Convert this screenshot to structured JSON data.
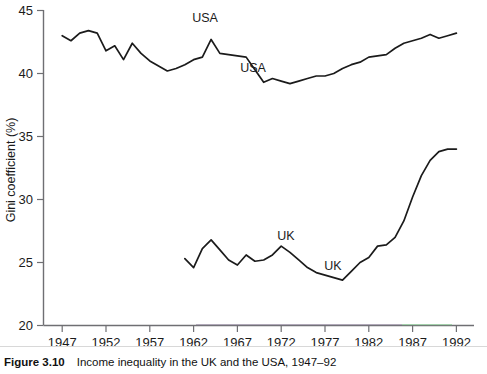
{
  "figure": {
    "number_label": "Figure 3.10",
    "caption": "Income inequality in the UK and the USA, 1947–92"
  },
  "axes": {
    "y_title": "Gini coefficient (%)",
    "y_ticks": [
      "20",
      "25",
      "30",
      "35",
      "40",
      "45"
    ],
    "x_ticks": [
      "1947",
      "1952",
      "1957",
      "1962",
      "1967",
      "1972",
      "1977",
      "1982",
      "1987",
      "1992"
    ]
  },
  "annotations": [
    {
      "name": "usa-label-upper",
      "text": "USA",
      "x": 205,
      "y": 22
    },
    {
      "name": "usa-label-lower",
      "text": "USA",
      "x": 253,
      "y": 72
    },
    {
      "name": "uk-label-upper",
      "text": "UK",
      "x": 286,
      "y": 240
    },
    {
      "name": "uk-label-lower",
      "text": "UK",
      "x": 333,
      "y": 270
    }
  ],
  "chart_data": {
    "type": "line",
    "title": "Income inequality in the UK and the USA, 1947–92",
    "xlabel": "",
    "ylabel": "Gini coefficient (%)",
    "xlim": [
      1946,
      1993
    ],
    "ylim": [
      20,
      45
    ],
    "grid": false,
    "legend": "inline-labels",
    "x": [
      1947,
      1948,
      1949,
      1950,
      1951,
      1952,
      1953,
      1954,
      1955,
      1956,
      1957,
      1958,
      1959,
      1960,
      1961,
      1962,
      1963,
      1964,
      1965,
      1966,
      1967,
      1968,
      1969,
      1970,
      1971,
      1972,
      1973,
      1974,
      1975,
      1976,
      1977,
      1978,
      1979,
      1980,
      1981,
      1982,
      1983,
      1984,
      1985,
      1986,
      1987,
      1988,
      1989,
      1990,
      1991,
      1992
    ],
    "series": [
      {
        "name": "USA",
        "color": "#1b1b1b",
        "values": [
          43.0,
          42.6,
          43.2,
          43.4,
          43.2,
          41.8,
          42.2,
          41.1,
          42.4,
          41.6,
          41.0,
          40.6,
          40.2,
          40.4,
          40.7,
          41.1,
          41.3,
          42.7,
          41.6,
          41.5,
          41.4,
          41.3,
          40.3,
          39.3,
          39.6,
          39.4,
          39.2,
          39.4,
          39.6,
          39.8,
          39.8,
          40.0,
          40.4,
          40.7,
          40.9,
          41.3,
          41.4,
          41.5,
          42.0,
          42.4,
          42.6,
          42.8,
          43.1,
          42.8,
          43.0,
          43.2
        ]
      },
      {
        "name": "UK",
        "color": "#1b1b1b",
        "values": [
          null,
          null,
          null,
          null,
          null,
          null,
          null,
          null,
          null,
          null,
          null,
          null,
          null,
          null,
          25.3,
          24.6,
          26.1,
          26.8,
          26.0,
          25.2,
          24.8,
          25.6,
          25.1,
          25.2,
          25.6,
          26.3,
          25.8,
          25.2,
          24.6,
          24.2,
          24.0,
          23.8,
          23.6,
          24.3,
          25.0,
          25.4,
          26.3,
          26.4,
          27.0,
          28.3,
          30.2,
          31.9,
          33.1,
          33.8,
          34.0,
          34.0
        ]
      }
    ]
  },
  "colors": {
    "line": "#1b1b1b",
    "axis": "#6f6f73",
    "text": "#111111",
    "background": "#ffffff"
  }
}
